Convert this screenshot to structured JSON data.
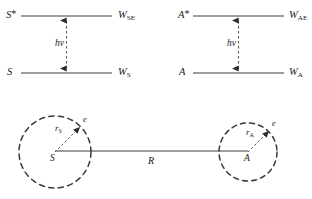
{
  "figure": {
    "background_color": "#ffffff",
    "line_color": "#7d7d7d",
    "dark_line_color": "#5a5a5a",
    "text_color": "#1a1a1a"
  },
  "energy_diagrams": [
    {
      "id": "sensitizer",
      "excited_state_label": "S",
      "excited_state_superscript": "*",
      "ground_state_label": "S",
      "excited_energy_symbol": "W",
      "excited_energy_subscript": "SE",
      "ground_energy_symbol": "W",
      "ground_energy_subscript": "S",
      "transition_label_h": "h",
      "transition_label_nu": "ν"
    },
    {
      "id": "activator",
      "excited_state_label": "A",
      "excited_state_superscript": "*",
      "ground_state_label": "A",
      "excited_energy_symbol": "W",
      "excited_energy_subscript": "AE",
      "ground_energy_symbol": "W",
      "ground_energy_subscript": "A",
      "transition_label_h": "h",
      "transition_label_nu": "ν"
    }
  ],
  "sphere_diagram": {
    "separation_label": "R",
    "spheres": [
      {
        "id": "sensitizer-sphere",
        "center_label": "S",
        "radius_symbol": "r",
        "radius_subscript": "S",
        "electron_label": "e"
      },
      {
        "id": "activator-sphere",
        "center_label": "A",
        "radius_symbol": "r",
        "radius_subscript": "A",
        "electron_label": "e"
      }
    ]
  }
}
